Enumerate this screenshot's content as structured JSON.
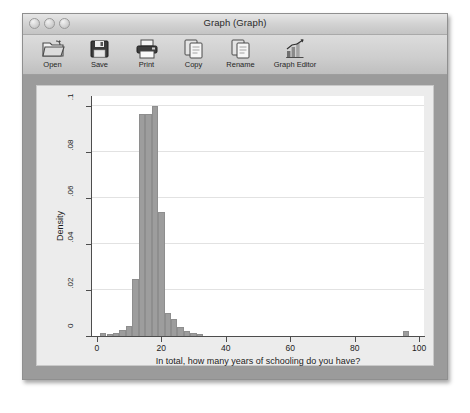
{
  "window": {
    "title": "Graph (Graph)",
    "controls": [
      {
        "name": "close-button",
        "label": ""
      },
      {
        "name": "minimize-button",
        "label": ""
      },
      {
        "name": "zoom-button",
        "label": ""
      }
    ]
  },
  "toolbar": {
    "items": [
      {
        "id": "open",
        "label": "Open",
        "icon": "folder-icon"
      },
      {
        "id": "save",
        "label": "Save",
        "icon": "floppy-disk-icon"
      },
      {
        "id": "print",
        "label": "Print",
        "icon": "printer-icon"
      },
      {
        "id": "copy",
        "label": "Copy",
        "icon": "copy-pages-icon"
      },
      {
        "id": "rename",
        "label": "Rename",
        "icon": "rename-pages-icon"
      },
      {
        "id": "graph-editor",
        "label": "Graph Editor",
        "icon": "bar-chart-icon"
      }
    ]
  },
  "colors": {
    "bar_fill": "#9d9d9d",
    "bar_stroke": "#8e8e8e",
    "plot_background": "#ffffff",
    "graph_background": "#ececec",
    "frame": "#9b9b9b",
    "gridline": "#e2e2e2",
    "axis": "#4d4d4d"
  },
  "chart_data": {
    "type": "bar",
    "title": "",
    "xlabel": "In total, how many years of schooling do you have?",
    "ylabel": "Density",
    "xlim": [
      -1.5,
      101.5
    ],
    "ylim": [
      0,
      0.1045
    ],
    "xticks": [
      0,
      20,
      40,
      60,
      80,
      100
    ],
    "xtick_labels": [
      "0",
      "20",
      "40",
      "60",
      "80",
      "100"
    ],
    "yticks": [
      0,
      0.02,
      0.04,
      0.06,
      0.08,
      0.1
    ],
    "ytick_labels": [
      "0",
      ".02",
      ".04",
      ".06",
      ".08",
      ".1"
    ],
    "grid": "horizontal",
    "legend": null,
    "bin_width": 2,
    "bins": [
      {
        "x0": -1,
        "x1": 1,
        "value": 0.0
      },
      {
        "x0": 1,
        "x1": 3,
        "value": 0.0013
      },
      {
        "x0": 3,
        "x1": 5,
        "value": 0.0009
      },
      {
        "x0": 5,
        "x1": 7,
        "value": 0.0013
      },
      {
        "x0": 7,
        "x1": 9,
        "value": 0.0026
      },
      {
        "x0": 9,
        "x1": 11,
        "value": 0.0044
      },
      {
        "x0": 11,
        "x1": 13,
        "value": 0.025
      },
      {
        "x0": 13,
        "x1": 15,
        "value": 0.0965
      },
      {
        "x0": 15,
        "x1": 17,
        "value": 0.0965
      },
      {
        "x0": 17,
        "x1": 19,
        "value": 0.1
      },
      {
        "x0": 19,
        "x1": 21,
        "value": 0.054
      },
      {
        "x0": 21,
        "x1": 23,
        "value": 0.01
      },
      {
        "x0": 23,
        "x1": 25,
        "value": 0.0075
      },
      {
        "x0": 25,
        "x1": 27,
        "value": 0.004
      },
      {
        "x0": 27,
        "x1": 29,
        "value": 0.0022
      },
      {
        "x0": 29,
        "x1": 31,
        "value": 0.0013
      },
      {
        "x0": 31,
        "x1": 33,
        "value": 0.0009
      },
      {
        "x0": 95,
        "x1": 97,
        "value": 0.0022
      }
    ]
  }
}
